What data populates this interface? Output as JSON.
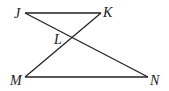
{
  "figure": {
    "type": "geometry",
    "points": {
      "J": {
        "label": "J",
        "x": 25,
        "y": 13
      },
      "K": {
        "label": "K",
        "x": 101,
        "y": 13
      },
      "L": {
        "label": "L",
        "x": 72,
        "y": 38
      },
      "M": {
        "label": "M",
        "x": 25,
        "y": 77
      },
      "N": {
        "label": "N",
        "x": 148,
        "y": 77
      }
    },
    "segments": [
      {
        "from": "J",
        "to": "K"
      },
      {
        "from": "J",
        "to": "N"
      },
      {
        "from": "K",
        "to": "M"
      },
      {
        "from": "M",
        "to": "N"
      }
    ],
    "labels": {
      "J": "J",
      "K": "K",
      "L": "L",
      "M": "M",
      "N": "N"
    },
    "colors": {
      "line": "#222222",
      "text": "#1a1a1a",
      "background": "#ffffff"
    }
  }
}
